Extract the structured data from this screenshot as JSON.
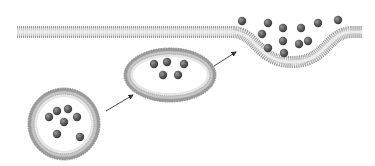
{
  "diagram": {
    "type": "exocytosis",
    "colors": {
      "background": "#ffffff",
      "membrane_outer": "#9a9a9a",
      "membrane_inner": "#c8c8c8",
      "membrane_core": "#e4e4e4",
      "particle": "#555555",
      "particle_highlight": "#8a8a8a",
      "arrow": "#333333"
    },
    "membrane": {
      "left_x": 17,
      "right_x": 362,
      "y": 32,
      "pocket_start_x": 232,
      "pocket_end_x": 352,
      "pocket_bottom_y": 62
    },
    "vesicles": [
      {
        "shape": "circle",
        "cx": 64,
        "cy": 124,
        "rx": 36,
        "ry": 36,
        "particles": [
          [
            57,
            111
          ],
          [
            68,
            109
          ],
          [
            49,
            117
          ],
          [
            77,
            117
          ],
          [
            64,
            122
          ],
          [
            57,
            134
          ],
          [
            80,
            137
          ]
        ]
      },
      {
        "shape": "ellipse",
        "cx": 170,
        "cy": 75,
        "rx": 46,
        "ry": 27,
        "particles": [
          [
            154,
            64
          ],
          [
            167,
            62
          ],
          [
            184,
            64
          ],
          [
            163,
            75
          ],
          [
            178,
            75
          ]
        ]
      }
    ],
    "released_particles": [
      [
        242,
        21
      ],
      [
        268,
        23
      ],
      [
        283,
        28
      ],
      [
        301,
        28
      ],
      [
        318,
        23
      ],
      [
        338,
        20
      ],
      [
        262,
        34
      ],
      [
        283,
        41
      ],
      [
        299,
        44
      ],
      [
        308,
        41
      ],
      [
        268,
        48
      ],
      [
        284,
        53
      ]
    ],
    "arrows": [
      {
        "x1": 106,
        "y1": 111,
        "x2": 133,
        "y2": 95
      },
      {
        "x1": 214,
        "y1": 66,
        "x2": 236,
        "y2": 52
      }
    ]
  }
}
